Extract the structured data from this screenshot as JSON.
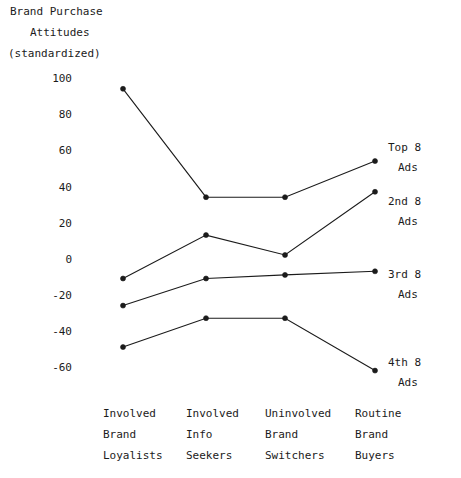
{
  "chart_data": {
    "type": "line",
    "title": "Brand Purchase Attitudes (standardized)",
    "title_lines": [
      "Brand Purchase",
      "Attitudes",
      "(standardized)"
    ],
    "xlabel": "",
    "ylabel": "Brand Purchase Attitudes (standardized)",
    "ylim": [
      -70,
      100
    ],
    "yticks": [
      100,
      80,
      60,
      40,
      20,
      0,
      -20,
      -40,
      -60
    ],
    "ytick_labels": [
      "100",
      "80",
      "60",
      "40",
      "20",
      "0",
      "-20",
      "-40",
      "-60"
    ],
    "grid": false,
    "legend_position": "right",
    "categories": [
      "Involved Brand Loyalists",
      "Involved Info Seekers",
      "Uninvolved Brand Switchers",
      "Routine Brand Buyers"
    ],
    "category_lines": [
      [
        "Involved",
        "Brand",
        "Loyalists"
      ],
      [
        "Involved",
        "Info",
        "Seekers"
      ],
      [
        "Uninvolved",
        "Brand",
        "Switchers"
      ],
      [
        "Routine",
        "Brand",
        "Buyers"
      ]
    ],
    "series": [
      {
        "name": "Top 8 Ads",
        "label_lines": [
          "Top 8",
          "Ads"
        ],
        "values": [
          94,
          34,
          34,
          54
        ]
      },
      {
        "name": "2nd 8 Ads",
        "label_lines": [
          "2nd 8",
          "Ads"
        ],
        "values": [
          -11,
          13,
          2,
          37
        ]
      },
      {
        "name": "3rd 8 Ads",
        "label_lines": [
          "3rd 8",
          "Ads"
        ],
        "values": [
          -26,
          -11,
          -9,
          -7
        ]
      },
      {
        "name": "4th 8 Ads",
        "label_lines": [
          "4th 8",
          "Ads"
        ],
        "values": [
          -49,
          -33,
          -33,
          -62
        ]
      }
    ],
    "colors": {
      "line": "#1b1b1b",
      "marker": "#1b1b1b",
      "background": "#ffffff"
    }
  },
  "ytick_positions": [
    78,
    114,
    150,
    187,
    223,
    259,
    295,
    331,
    367
  ],
  "category_x": [
    103,
    186,
    265,
    355
  ],
  "legend_y": [
    147,
    201,
    274,
    362
  ]
}
